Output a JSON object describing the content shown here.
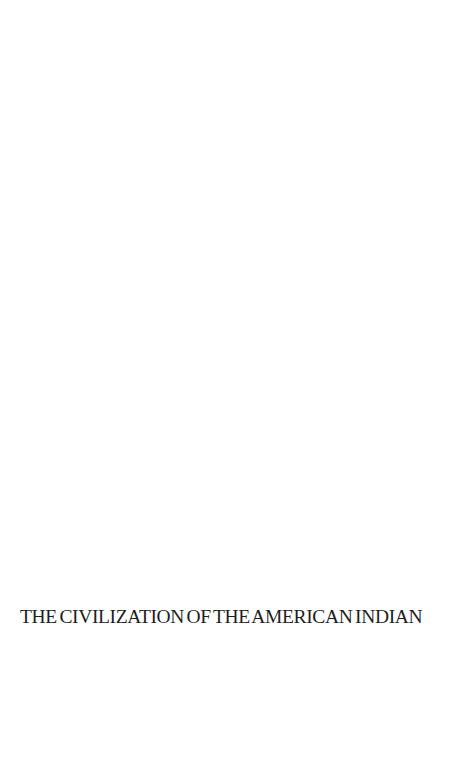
{
  "page": {
    "background": "#ffffff",
    "text_color": "#1e1e1e"
  },
  "series_title": "THE CIVILIZATION OF THE AMERICAN INDIAN"
}
